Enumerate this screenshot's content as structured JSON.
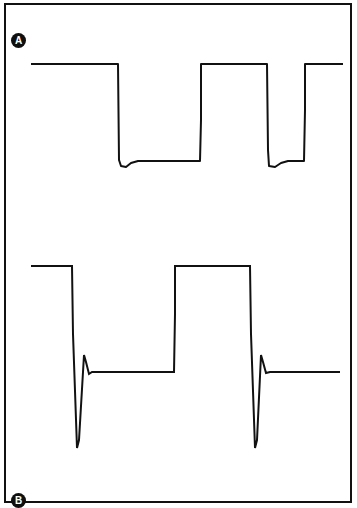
{
  "figure": {
    "width": 357,
    "height": 508,
    "background_color": "#ffffff",
    "frame_color": "#111111",
    "trace_color": "#111111",
    "panel_count": 2
  },
  "panels": [
    {
      "id": "panel-a",
      "label": "A",
      "label_style": "white-letter-on-black-circle"
    },
    {
      "id": "panel-b",
      "label": "B",
      "label_style": "white-letter-on-black-circle"
    }
  ],
  "chart_data": [
    {
      "type": "line",
      "title": "A",
      "xlabel": "",
      "ylabel": "",
      "xlim": [
        0,
        357
      ],
      "ylim": [
        254,
        0
      ],
      "grid": false,
      "legend": "none",
      "description": "Rounded / slightly-sagging square wave trace, high level flat, low level with small rounded undershoot recovery at each falling edge",
      "series": [
        {
          "name": "trace-a",
          "color": "#111111",
          "points": [
            [
              31,
              64
            ],
            [
              118,
              64
            ],
            [
              119,
              160
            ],
            [
              121,
              166
            ],
            [
              126,
              167
            ],
            [
              131,
              163
            ],
            [
              138,
              161
            ],
            [
              200,
              161
            ],
            [
              201,
              120
            ],
            [
              201,
              64
            ],
            [
              267,
              64
            ],
            [
              268,
              150
            ],
            [
              269,
              166
            ],
            [
              275,
              167
            ],
            [
              281,
              163
            ],
            [
              288,
              161
            ],
            [
              304,
              161
            ],
            [
              305,
              110
            ],
            [
              305,
              64
            ],
            [
              343,
              64
            ]
          ]
        }
      ]
    },
    {
      "type": "line",
      "title": "B",
      "xlabel": "",
      "ylabel": "",
      "xlim": [
        0,
        357
      ],
      "ylim": [
        254,
        0
      ],
      "grid": false,
      "legend": "none",
      "description": "Differentiated / AC-coupled square wave: flat high level, steep falling spike with large undershoot, sharp overshoot peak, then decay to baseline; repeats twice",
      "series": [
        {
          "name": "trace-b",
          "color": "#111111",
          "points": [
            [
              31,
              12
            ],
            [
              72,
              12
            ],
            [
              73,
              80
            ],
            [
              77,
              194
            ],
            [
              79,
              186
            ],
            [
              84,
              101
            ],
            [
              86,
              108
            ],
            [
              89,
              120
            ],
            [
              92,
              118
            ],
            [
              96,
              118
            ],
            [
              174,
              118
            ],
            [
              175,
              60
            ],
            [
              175,
              12
            ],
            [
              250,
              12
            ],
            [
              251,
              80
            ],
            [
              255,
              194
            ],
            [
              257,
              186
            ],
            [
              261,
              101
            ],
            [
              263,
              108
            ],
            [
              266,
              119
            ],
            [
              270,
              118
            ],
            [
              274,
              118
            ],
            [
              340,
              118
            ]
          ]
        }
      ]
    }
  ]
}
